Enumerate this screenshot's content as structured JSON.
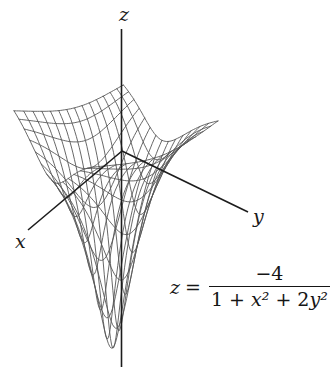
{
  "chart_data": {
    "type": "surface-wireframe",
    "function_formula": "z = -4/(1 + x^2 + 2y^2)",
    "function_coefficients": {
      "numerator_constant": -4,
      "denominator_constant": 1,
      "x_squared_coeff": 1,
      "y_squared_coeff": 2
    },
    "domain": {
      "x_min": -2,
      "x_max": 2,
      "y_min": -2,
      "y_max": 2
    },
    "z_min": -4,
    "grid_divisions": 14,
    "samples_per_line": 56,
    "axis_labels": {
      "x": "x",
      "y": "y",
      "z": "z"
    },
    "equation_label": {
      "lhs_variable": "z",
      "equals_sign": "=",
      "numerator": "−4",
      "denominator_parts": {
        "constant": "1 + ",
        "x_term": "x²",
        "plus": " + 2",
        "y_term": "y²"
      }
    },
    "style": {
      "mesh_color": "#575757",
      "axis_color": "#1c1c1c",
      "mesh_stroke_width": 0.9,
      "axis_stroke_width": 1.6,
      "background": "#ffffff"
    },
    "view": {
      "fit_landmarks_px": {
        "back_corner": [
          127,
          85
        ],
        "left_corner": [
          14,
          110
        ],
        "right_corner": [
          218,
          122
        ],
        "funnel_tip": [
          121,
          348
        ]
      },
      "axes_px": {
        "z": [
          [
            121.5,
            29
          ],
          [
            121.5,
            367
          ]
        ],
        "x": [
          [
            122,
            151
          ],
          [
            28,
            230
          ]
        ],
        "y": [
          [
            122,
            151
          ],
          [
            248,
            212
          ]
        ]
      },
      "label_px": {
        "x": [
          20,
          248
        ],
        "y": [
          258,
          223
        ],
        "z": [
          124,
          21
        ]
      }
    }
  }
}
